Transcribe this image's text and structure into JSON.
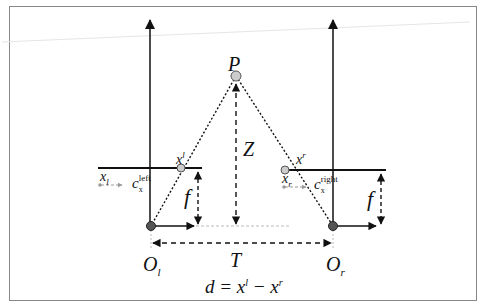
{
  "diagram": {
    "labels": {
      "point": "P",
      "depth": "Z",
      "left_image_point": "x",
      "left_image_point_sup": "l",
      "right_image_point": "x",
      "right_image_point_sup": "r",
      "left_image_coord": "x",
      "left_image_coord_sub": "l",
      "right_image_coord": "x",
      "right_image_coord_sub": "r",
      "left_principal": "c",
      "left_principal_sub": "x",
      "left_principal_sup": "left",
      "right_principal": "c",
      "right_principal_sub": "x",
      "right_principal_sup": "right",
      "focal_left": "f",
      "focal_right": "f",
      "left_center": "O",
      "left_center_sub": "l",
      "right_center": "O",
      "right_center_sub": "r",
      "baseline": "T",
      "equation": "d = x",
      "equation_sup1": "l",
      "equation_mid": " − x",
      "equation_sup2": "r"
    },
    "colors": {
      "line": "#111111",
      "frame": "#888888",
      "point_fill": "#bbbbbb",
      "center_fill": "#555555",
      "faint": "#bbbbbb"
    }
  }
}
